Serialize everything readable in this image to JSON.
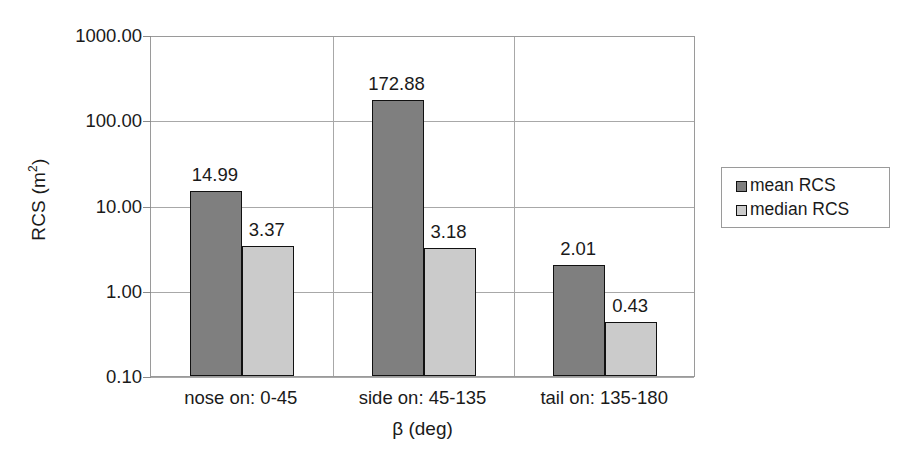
{
  "chart_data": {
    "type": "bar",
    "title": "",
    "xlabel": "β (deg)",
    "ylabel": "RCS (m",
    "ylabel_sup": "2",
    "ylabel_suffix": ")",
    "yscale": "log",
    "ylim": [
      0.1,
      1000.0
    ],
    "ytick_labels": [
      "1000.00",
      "100.00",
      "10.00",
      "1.00",
      "0.10"
    ],
    "ytick_values": [
      1000.0,
      100.0,
      10.0,
      1.0,
      0.1
    ],
    "grid": "horizontal-and-category-separators",
    "legend_position": "right",
    "categories": [
      "nose on:  0-45",
      "side on: 45-135",
      "tail on: 135-180"
    ],
    "series": [
      {
        "name": "mean RCS",
        "color": "#7f7f7f",
        "values": [
          14.99,
          172.88,
          2.01
        ],
        "labels": [
          "14.99",
          "172.88",
          "2.01"
        ]
      },
      {
        "name": "median RCS",
        "color": "#cbcbcb",
        "values": [
          3.37,
          3.18,
          0.43
        ],
        "labels": [
          "3.37",
          "3.18",
          "0.43"
        ]
      }
    ]
  },
  "legend": {
    "items": [
      {
        "label": "mean RCS",
        "swatch": "mean"
      },
      {
        "label": "median RCS",
        "swatch": "median"
      }
    ]
  },
  "colors": {
    "mean_bar": "#7f7f7f",
    "median_bar": "#cbcbcb",
    "bar_outline": "#111111",
    "gridline": "#a8a8a8",
    "plot_border": "#9a9a9a",
    "text": "#1a1a1a",
    "background": "#ffffff"
  }
}
